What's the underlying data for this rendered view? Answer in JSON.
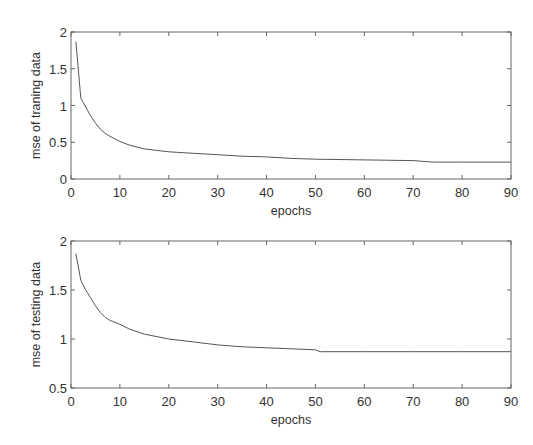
{
  "chart_data": [
    {
      "type": "line",
      "title": "",
      "xlabel": "epochs",
      "ylabel": "mse of traning data",
      "xlim": [
        0,
        90
      ],
      "ylim": [
        0,
        2
      ],
      "xticks": [
        0,
        10,
        20,
        30,
        40,
        50,
        60,
        70,
        80,
        90
      ],
      "yticks": [
        0,
        0.5,
        1,
        1.5,
        2
      ],
      "ytick_labels": [
        "0",
        "0.5",
        "1",
        "1.5",
        "2"
      ],
      "grid": false,
      "legend": null,
      "series": [
        {
          "name": "training mse",
          "x": [
            1,
            2,
            3,
            4,
            5,
            6,
            7,
            8,
            10,
            12,
            15,
            20,
            25,
            30,
            35,
            40,
            45,
            50,
            60,
            70,
            74,
            80,
            90
          ],
          "values": [
            1.87,
            1.1,
            0.98,
            0.86,
            0.76,
            0.68,
            0.62,
            0.58,
            0.51,
            0.46,
            0.41,
            0.37,
            0.35,
            0.33,
            0.31,
            0.3,
            0.28,
            0.27,
            0.26,
            0.25,
            0.23,
            0.23,
            0.23
          ]
        }
      ]
    },
    {
      "type": "line",
      "title": "",
      "xlabel": "epochs",
      "ylabel": "mse of testing data",
      "xlim": [
        0,
        90
      ],
      "ylim": [
        0.5,
        2
      ],
      "xticks": [
        0,
        10,
        20,
        30,
        40,
        50,
        60,
        70,
        80,
        90
      ],
      "yticks": [
        0.5,
        1,
        1.5,
        2
      ],
      "ytick_labels": [
        "0.5",
        "1",
        "1.5",
        "2"
      ],
      "grid": false,
      "legend": null,
      "series": [
        {
          "name": "testing mse",
          "x": [
            1,
            2,
            3,
            4,
            5,
            6,
            7,
            8,
            10,
            12,
            15,
            20,
            25,
            30,
            35,
            40,
            45,
            50,
            51,
            60,
            70,
            80,
            90
          ],
          "values": [
            1.87,
            1.6,
            1.5,
            1.42,
            1.34,
            1.27,
            1.22,
            1.19,
            1.15,
            1.1,
            1.05,
            1.0,
            0.97,
            0.94,
            0.92,
            0.91,
            0.9,
            0.89,
            0.87,
            0.87,
            0.87,
            0.87,
            0.87
          ]
        }
      ]
    }
  ],
  "charts": [
    {
      "ylabel": "mse of traning data",
      "xlabel": "epochs"
    },
    {
      "ylabel": "mse of testing data",
      "xlabel": "epochs"
    }
  ]
}
